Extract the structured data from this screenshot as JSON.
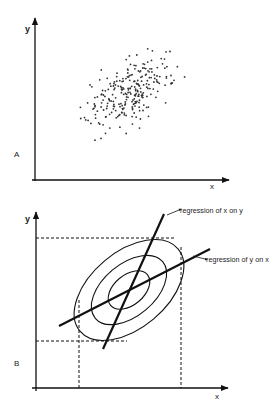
{
  "panel_a": {
    "label": "A",
    "x_axis_label": "x",
    "y_axis_label": "y",
    "scatter": {
      "center": [
        130,
        92
      ],
      "angle_deg": -40,
      "sigma_major": 36,
      "sigma_minor": 15,
      "count": 260,
      "dot_color": "#333333"
    }
  },
  "panel_b": {
    "label": "B",
    "x_axis_label": "x",
    "y_axis_label": "y",
    "ellipses": {
      "center": [
        129,
        290
      ],
      "angle_deg": -40,
      "radii": [
        [
          64,
          38
        ],
        [
          44,
          26
        ],
        [
          24,
          15
        ]
      ]
    },
    "regression_x_on_y": {
      "label": "regression of x on y",
      "from": [
        103,
        349
      ],
      "to": [
        164,
        214
      ]
    },
    "regression_y_on_x": {
      "label": "regression of y on x",
      "from": [
        59,
        326
      ],
      "to": [
        210,
        249
      ]
    },
    "dashed_guides": {
      "top_y": 238,
      "top_x_end": 176,
      "bottom_y": 341,
      "bottom_x_end": 127,
      "left_x": 79,
      "left_y_start": 300,
      "right_x": 181,
      "right_y_start": 247
    }
  }
}
